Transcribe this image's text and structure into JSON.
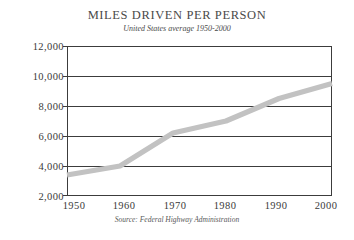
{
  "chart_data": {
    "type": "line",
    "title": "MILES DRIVEN PER PERSON",
    "subtitle": "United States average 1950-2000",
    "source": "Source: Federal Highway Administration",
    "xlabel": "",
    "ylabel": "",
    "categories": [
      "1950",
      "1960",
      "1970",
      "1980",
      "1990",
      "2000"
    ],
    "x": [
      1950,
      1960,
      1970,
      1980,
      1990,
      2000
    ],
    "values": [
      3400,
      4000,
      6200,
      7000,
      8500,
      9500
    ],
    "series": [
      {
        "name": "Miles driven per person",
        "values": [
          3400,
          4000,
          6200,
          7000,
          8500,
          9500
        ]
      }
    ],
    "ylim": [
      2000,
      12000
    ],
    "xlim": [
      1950,
      2000
    ],
    "ytick_labels": [
      "12,000",
      "10,000",
      "8,000",
      "6,000",
      "4,000",
      "2,000"
    ],
    "ytick_values": [
      12000,
      10000,
      8000,
      6000,
      4000,
      2000
    ],
    "xtick_labels": [
      "1950",
      "1960",
      "1970",
      "1980",
      "1990",
      "2000"
    ],
    "grid": "horizontal",
    "legend": "none",
    "line_color": "#c2c2c2",
    "axis_color": "#3c3c3c",
    "text_color": "#3a3a3a",
    "background": "#ffffff"
  }
}
